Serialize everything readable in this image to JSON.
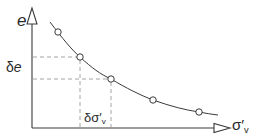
{
  "diagram": {
    "axes": {
      "y_label": "e",
      "x_label_symbol": "σ′",
      "x_label_subscript": "v"
    },
    "increments": {
      "delta_e_prefix": "δ",
      "delta_e_var": "e",
      "delta_sigma_symbol": "δσ′",
      "delta_sigma_subscript": "v"
    },
    "points": [
      {
        "x": 58,
        "y": 32
      },
      {
        "x": 80,
        "y": 57
      },
      {
        "x": 111,
        "y": 79
      },
      {
        "x": 153,
        "y": 100
      },
      {
        "x": 199,
        "y": 112
      }
    ],
    "colors": {
      "line": "#3a3a3a",
      "guide": "#9a9a9a",
      "background": "#ffffff"
    }
  }
}
